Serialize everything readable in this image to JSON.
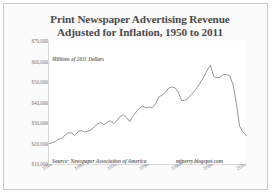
{
  "chart_data": {
    "type": "line",
    "title": "Print Newspaper Advertising Revenue Adjusted for Inflation, 1950 to 2011",
    "title_line1": "Print Newspaper Advertising Revenue",
    "title_line2": "Adjusted for Inflation, 1950 to 2011",
    "annotation": "Millions of 2011 Dollars",
    "source": "Source: Newspaper Association of America",
    "attribution": "mjperry.blogspot.com",
    "xlabel": "",
    "ylabel": "",
    "grid": false,
    "legend": false,
    "line_color": "#8a8a8a",
    "ylim": [
      10000,
      70000
    ],
    "xlim": [
      1950,
      2011
    ],
    "ytick_labels": [
      "$70,000",
      "$60,000",
      "$50,000",
      "$40,000",
      "$30,000",
      "$20,000",
      "$10,000"
    ],
    "ytick_values": [
      70000,
      60000,
      50000,
      40000,
      30000,
      20000,
      10000
    ],
    "xtick_labels": [
      "1950",
      "1960",
      "1970",
      "1980",
      "1990",
      "2000",
      "2010"
    ],
    "xtick_values": [
      1950,
      1960,
      1970,
      1980,
      1990,
      2000,
      2010
    ],
    "x": [
      1950,
      1951,
      1952,
      1953,
      1954,
      1955,
      1956,
      1957,
      1958,
      1959,
      1960,
      1961,
      1962,
      1963,
      1964,
      1965,
      1966,
      1967,
      1968,
      1969,
      1970,
      1971,
      1972,
      1973,
      1974,
      1975,
      1976,
      1977,
      1978,
      1979,
      1980,
      1981,
      1982,
      1983,
      1984,
      1985,
      1986,
      1987,
      1988,
      1989,
      1990,
      1991,
      1992,
      1993,
      1994,
      1995,
      1996,
      1997,
      1998,
      1999,
      2000,
      2001,
      2002,
      2003,
      2004,
      2005,
      2006,
      2007,
      2008,
      2009,
      2010,
      2011
    ],
    "values": [
      19900,
      20400,
      21000,
      22100,
      22400,
      24200,
      25300,
      25100,
      23900,
      25700,
      26300,
      25600,
      26000,
      26700,
      28100,
      29400,
      30300,
      29100,
      30300,
      31100,
      29700,
      31000,
      33200,
      34000,
      32600,
      30600,
      33300,
      35400,
      37300,
      38200,
      37400,
      37800,
      37500,
      39300,
      42600,
      43600,
      44900,
      46900,
      47600,
      47200,
      45200,
      41000,
      41100,
      41900,
      43800,
      45500,
      47600,
      50000,
      52600,
      55800,
      58200,
      52700,
      52000,
      52400,
      53600,
      53700,
      52900,
      48700,
      39800,
      28500,
      25800,
      23900
    ],
    "peaks": [
      {
        "year": 1988,
        "value": 47600,
        "label": "late-1980s peak"
      },
      {
        "year": 2000,
        "value": 58200,
        "label": "2000 peak"
      }
    ],
    "end_value": 23900
  }
}
